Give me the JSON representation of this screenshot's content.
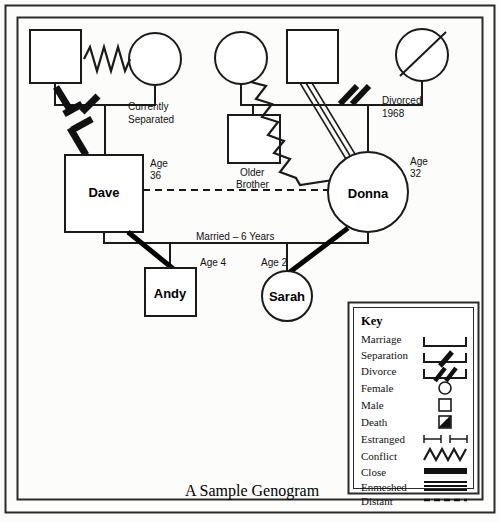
{
  "page": {
    "title": "A Sample Genogram",
    "background": "#fcfcfb",
    "ink": "#1a1a1a"
  },
  "annotations": {
    "currently_separated": "Currently\nSeparated",
    "currently_separated_l1": "Currently",
    "currently_separated_l2": "Separated",
    "divorced_1968_l1": "Divorced",
    "divorced_1968_l2": "1968",
    "older_brother_l1": "Older",
    "older_brother_l2": "Brother",
    "married_six_years": "Married – 6 Years",
    "age_36_l1": "Age",
    "age_36_l2": "36",
    "age_32_l1": "Age",
    "age_32_l2": "32",
    "age_4": "Age 4",
    "age_2": "Age 2"
  },
  "people": [
    {
      "id": "dave-father",
      "name": "",
      "gender": "male",
      "label": ""
    },
    {
      "id": "dave-mother",
      "name": "",
      "gender": "female",
      "label": ""
    },
    {
      "id": "dave",
      "name": "Dave",
      "gender": "male",
      "label": "Dave",
      "age": "36"
    },
    {
      "id": "donna-mother",
      "name": "",
      "gender": "female",
      "label": ""
    },
    {
      "id": "donna-father",
      "name": "",
      "gender": "male",
      "label": ""
    },
    {
      "id": "older-brother",
      "name": "",
      "gender": "male",
      "label": "Older Brother"
    },
    {
      "id": "donna-stepmother",
      "name": "",
      "gender": "female",
      "label": "",
      "deceased": true
    },
    {
      "id": "donna",
      "name": "Donna",
      "gender": "female",
      "label": "Donna",
      "age": "32"
    },
    {
      "id": "andy",
      "name": "Andy",
      "gender": "male",
      "label": "Andy",
      "age": "4"
    },
    {
      "id": "sarah",
      "name": "Sarah",
      "gender": "female",
      "label": "Sarah",
      "age": "2"
    }
  ],
  "key": {
    "heading": "Key",
    "items": [
      {
        "label": "Marriage",
        "symbol": "marriage-bracket"
      },
      {
        "label": "Separation",
        "symbol": "separation-single-slash"
      },
      {
        "label": "Divorce",
        "symbol": "divorce-double-slash"
      },
      {
        "label": "Female",
        "symbol": "circle-outline"
      },
      {
        "label": "Male",
        "symbol": "square-outline"
      },
      {
        "label": "Death",
        "symbol": "square-with-diagonal"
      },
      {
        "label": "Estranged",
        "symbol": "broken-bar"
      },
      {
        "label": "Conflict",
        "symbol": "zigzag-line"
      },
      {
        "label": "Close",
        "symbol": "thick-solid-bar"
      },
      {
        "label": "Enmeshed",
        "symbol": "triple-line"
      },
      {
        "label": "Distant",
        "symbol": "dashed-line"
      }
    ]
  }
}
